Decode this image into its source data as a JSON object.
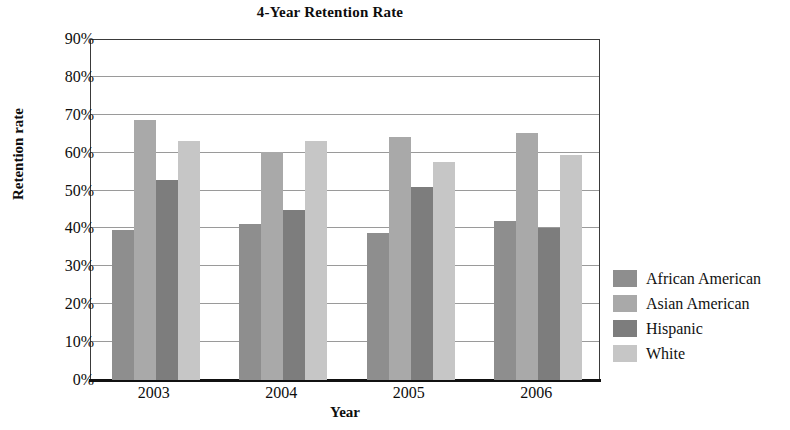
{
  "chart_data": {
    "type": "bar",
    "title": "4-Year Retention Rate",
    "xlabel": "Year",
    "ylabel": "Retention rate",
    "categories": [
      "2003",
      "2004",
      "2005",
      "2006"
    ],
    "ylim": [
      0,
      90
    ],
    "ytick_labels": [
      "0%",
      "10%",
      "20%",
      "30%",
      "40%",
      "50%",
      "60%",
      "70%",
      "80%",
      "90%"
    ],
    "ytick_values": [
      0,
      10,
      20,
      30,
      40,
      50,
      60,
      70,
      80,
      90
    ],
    "grid": true,
    "legend_position": "right",
    "series": [
      {
        "name": "African American",
        "color": "#8e8e8e",
        "values": [
          39.7,
          41.2,
          38.8,
          42.0
        ]
      },
      {
        "name": "Asian American",
        "color": "#a9a9a9",
        "values": [
          68.6,
          60.3,
          64.1,
          65.3
        ]
      },
      {
        "name": "Hispanic",
        "color": "#7d7d7d",
        "values": [
          52.7,
          44.9,
          51.0,
          40.2
        ]
      },
      {
        "name": "White",
        "color": "#c6c6c6",
        "values": [
          63.0,
          63.2,
          57.5,
          59.4
        ]
      }
    ]
  }
}
